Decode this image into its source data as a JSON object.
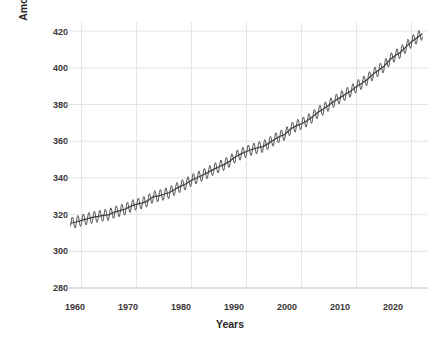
{
  "chart_data": {
    "type": "line",
    "title": "",
    "xlabel": "Years",
    "ylabel": "Amount of carbon dioxide (parts per million)",
    "xlim": [
      1957,
      2023
    ],
    "ylim": [
      280,
      425
    ],
    "xticks": [
      "1960",
      "1970",
      "1980",
      "1990",
      "2000",
      "2010",
      "2020"
    ],
    "xtick_values": [
      1960,
      1970,
      1980,
      1990,
      2000,
      2010,
      2020
    ],
    "yticks": [
      "280",
      "300",
      "320",
      "340",
      "360",
      "380",
      "400",
      "420"
    ],
    "ytick_values": [
      280,
      300,
      320,
      340,
      360,
      380,
      400,
      420
    ],
    "grid": true,
    "legend": "none",
    "seasonal_amplitude_ppm": 3.2,
    "series": [
      {
        "name": "Monthly mean CO2",
        "note": "Monthly values with seasonal cycle superimposed on annual trend",
        "x": [
          1958,
          1959,
          1960,
          1961,
          1962,
          1963,
          1964,
          1965,
          1966,
          1967,
          1968,
          1969,
          1970,
          1971,
          1972,
          1973,
          1974,
          1975,
          1976,
          1977,
          1978,
          1979,
          1980,
          1981,
          1982,
          1983,
          1984,
          1985,
          1986,
          1987,
          1988,
          1989,
          1990,
          1991,
          1992,
          1993,
          1994,
          1995,
          1996,
          1997,
          1998,
          1999,
          2000,
          2001,
          2002,
          2003,
          2004,
          2005,
          2006,
          2007,
          2008,
          2009,
          2010,
          2011,
          2012,
          2013,
          2014,
          2015,
          2016,
          2017,
          2018,
          2019,
          2020,
          2021,
          2022
        ],
        "values": [
          315.3,
          315.98,
          316.91,
          317.64,
          318.45,
          318.99,
          319.62,
          320.04,
          321.38,
          322.16,
          323.04,
          324.62,
          325.68,
          326.32,
          327.45,
          329.68,
          330.18,
          331.11,
          332.04,
          333.83,
          335.4,
          336.84,
          338.75,
          340.11,
          341.45,
          343.05,
          344.65,
          346.12,
          347.42,
          349.19,
          351.57,
          353.12,
          354.39,
          355.61,
          356.45,
          357.1,
          358.83,
          360.82,
          362.61,
          363.73,
          366.7,
          368.38,
          369.55,
          371.14,
          373.28,
          375.8,
          377.52,
          379.8,
          381.9,
          383.79,
          385.6,
          387.43,
          389.9,
          391.65,
          393.85,
          396.52,
          398.65,
          400.83,
          404.24,
          406.55,
          408.52,
          411.44,
          414.24,
          416.45,
          418.56
        ]
      }
    ]
  }
}
